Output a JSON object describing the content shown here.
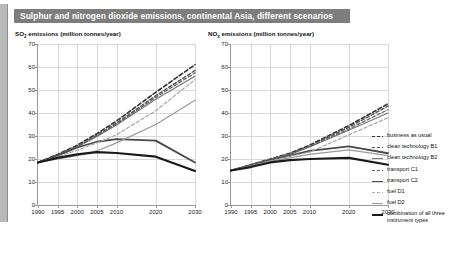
{
  "header": {
    "title": "Sulphur and nitrogen dioxide emissions, continental Asia, different scenarios",
    "band_color": "#7d7d7d"
  },
  "legend": {
    "position": "right",
    "items": [
      {
        "label": "business as usual",
        "color": "#333333",
        "style": "dashed",
        "width": 1.6
      },
      {
        "label": "clean technology B1",
        "color": "#555555",
        "style": "dashed",
        "width": 1.4
      },
      {
        "label": "clean technology B2",
        "color": "#777777",
        "style": "solid",
        "width": 1.2
      },
      {
        "label": "transport C1",
        "color": "#666666",
        "style": "dashed",
        "width": 1.3
      },
      {
        "label": "transport C2",
        "color": "#4a4a4a",
        "style": "solid",
        "width": 1.8
      },
      {
        "label": "fuel D1",
        "color": "#a8a8a8",
        "style": "dashed",
        "width": 1.2
      },
      {
        "label": "fuel D2",
        "color": "#9a9a9a",
        "style": "solid",
        "width": 1.2
      },
      {
        "label": "combination of all three instrument types",
        "color": "#1a1a1a",
        "style": "solid",
        "width": 2.2
      }
    ]
  },
  "chart_data": [
    {
      "type": "line",
      "panel": "left",
      "title": "SO₂ emissions (million tonnes/year)",
      "title_main": "SO",
      "title_sub": "2",
      "title_rest": " emissions (million tonnes/year)",
      "xlabel": "",
      "ylabel": "",
      "ylim": [
        0,
        70
      ],
      "yticks": [
        0,
        10,
        20,
        30,
        40,
        50,
        60,
        70
      ],
      "x": [
        1990,
        1995,
        2000,
        2005,
        2010,
        2020,
        2030
      ],
      "xticks": [
        "1990",
        "1995",
        "2000",
        "2005",
        "2010",
        "2020",
        "2030"
      ],
      "grid": true,
      "series": [
        {
          "name": "business as usual",
          "values": [
            18.5,
            22.0,
            26.0,
            31.0,
            36.5,
            49.0,
            61.0
          ]
        },
        {
          "name": "clean technology B1",
          "values": [
            18.5,
            21.8,
            25.6,
            30.4,
            35.6,
            47.5,
            58.5
          ]
        },
        {
          "name": "clean technology B2",
          "values": [
            18.5,
            21.6,
            25.2,
            29.8,
            34.8,
            46.0,
            56.0
          ]
        },
        {
          "name": "transport C1",
          "values": [
            18.5,
            21.7,
            25.4,
            30.0,
            35.2,
            46.8,
            57.5
          ]
        },
        {
          "name": "transport C2",
          "values": [
            18.5,
            21.5,
            25.0,
            27.5,
            28.6,
            28.0,
            18.5
          ]
        },
        {
          "name": "fuel D1",
          "values": [
            18.5,
            21.0,
            23.8,
            27.0,
            30.5,
            41.0,
            54.5
          ]
        },
        {
          "name": "fuel D2",
          "values": [
            18.5,
            20.0,
            21.5,
            23.5,
            27.0,
            35.0,
            45.5
          ]
        },
        {
          "name": "combination of all three instrument types",
          "values": [
            18.5,
            20.5,
            22.0,
            23.0,
            22.6,
            21.0,
            14.8
          ]
        }
      ]
    },
    {
      "type": "line",
      "panel": "right",
      "title": "NOₓ emissions (million tonnes/year)",
      "title_main": "NO",
      "title_sub": "x",
      "title_rest": " emissions (million tonnes/year)",
      "xlabel": "",
      "ylabel": "",
      "ylim": [
        0,
        70
      ],
      "yticks": [
        0,
        10,
        20,
        30,
        40,
        50,
        60,
        70
      ],
      "x": [
        1990,
        1995,
        2000,
        2005,
        2010,
        2020,
        2030
      ],
      "xticks": [
        "1990",
        "1995",
        "2000",
        "2005",
        "2010",
        "2020",
        "2030"
      ],
      "grid": true,
      "series": [
        {
          "name": "business as usual",
          "values": [
            15.0,
            17.5,
            20.0,
            22.5,
            26.0,
            34.5,
            44.0
          ]
        },
        {
          "name": "clean technology B1",
          "values": [
            15.0,
            17.4,
            19.8,
            22.2,
            25.6,
            33.8,
            43.0
          ]
        },
        {
          "name": "clean technology B2",
          "values": [
            15.0,
            17.3,
            19.6,
            22.0,
            25.2,
            32.5,
            40.0
          ]
        },
        {
          "name": "transport C1",
          "values": [
            15.0,
            17.3,
            19.7,
            22.1,
            25.4,
            33.0,
            41.5
          ]
        },
        {
          "name": "transport C2",
          "values": [
            15.0,
            17.2,
            19.5,
            21.5,
            23.5,
            25.5,
            22.5
          ]
        },
        {
          "name": "fuel D1",
          "values": [
            15.0,
            17.0,
            19.2,
            21.2,
            23.0,
            30.5,
            38.0
          ]
        },
        {
          "name": "fuel D2",
          "values": [
            15.0,
            16.8,
            19.0,
            20.5,
            22.0,
            24.0,
            21.5
          ]
        },
        {
          "name": "combination of all three instrument types",
          "values": [
            15.0,
            16.5,
            18.5,
            19.5,
            20.0,
            20.5,
            17.5
          ]
        }
      ]
    }
  ]
}
